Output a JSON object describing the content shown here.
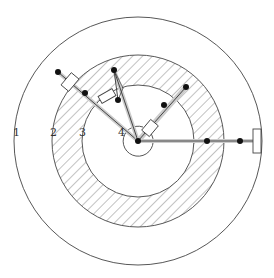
{
  "diagram": {
    "type": "concentric-circles-linkage",
    "colors": {
      "stroke": "#444444",
      "hatch": "#666666",
      "rod_fill": "#d8d8d8",
      "joint": "#111111",
      "background": "#ffffff"
    },
    "center": [
      138,
      141
    ],
    "circles": [
      {
        "id": "1",
        "r": 124,
        "hatched": false
      },
      {
        "id": "2",
        "r": 86,
        "hatched": true
      },
      {
        "id": "3",
        "r": 56,
        "hatched": false
      },
      {
        "id": "4",
        "r": 15,
        "hatched": false
      }
    ],
    "labels": [
      {
        "text": "1",
        "x": 14,
        "y": 132
      },
      {
        "text": "2",
        "x": 51,
        "y": 132
      },
      {
        "text": "3",
        "x": 80,
        "y": 132
      },
      {
        "text": "4",
        "x": 119,
        "y": 132
      }
    ]
  }
}
